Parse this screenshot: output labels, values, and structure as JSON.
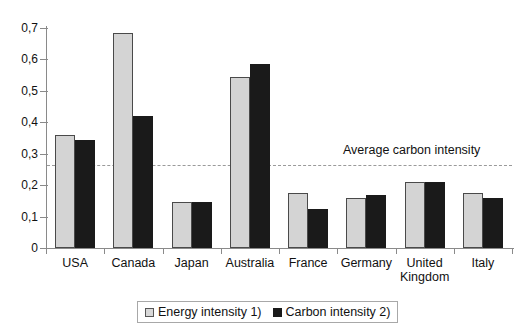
{
  "chart_data": {
    "type": "bar",
    "title": "",
    "xlabel": "",
    "ylabel": "",
    "ylim": [
      0,
      0.7
    ],
    "yticks": [
      "0",
      "0,1",
      "0,2",
      "0,3",
      "0,4",
      "0,5",
      "0,6",
      "0,7"
    ],
    "ytick_values": [
      0,
      0.1,
      0.2,
      0.3,
      0.4,
      0.5,
      0.6,
      0.7
    ],
    "grid": false,
    "legend_position": "bottom",
    "categories": [
      "USA",
      "Canada",
      "Japan",
      "Australia",
      "France",
      "Germany",
      "United Kingdom",
      "Italy"
    ],
    "series": [
      {
        "name": "Energy intensity 1)",
        "color": "#d4d4d4",
        "values": [
          0.36,
          0.685,
          0.145,
          0.545,
          0.175,
          0.16,
          0.21,
          0.175
        ]
      },
      {
        "name": "Carbon intensity 2)",
        "color": "#1a1a1a",
        "values": [
          0.345,
          0.42,
          0.145,
          0.585,
          0.125,
          0.17,
          0.21,
          0.16
        ]
      }
    ],
    "annotations": [
      {
        "name": "average-carbon-intensity-line",
        "label": "Average carbon intensity",
        "value": 0.265,
        "style": "dashed",
        "color": "#9a9a9a"
      }
    ]
  },
  "legend": {
    "items": [
      {
        "label": "Energy intensity 1)",
        "swatch": "energy-swatch"
      },
      {
        "label": "Carbon intensity 2)",
        "swatch": "carbon-swatch"
      }
    ]
  }
}
